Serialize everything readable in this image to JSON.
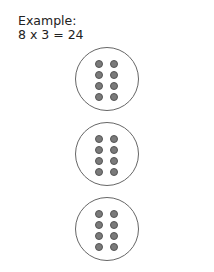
{
  "example": {
    "label": "Example:",
    "equation": "8 x 3 = 24"
  },
  "groups": [
    {
      "name": "group-1",
      "dots": 8
    },
    {
      "name": "group-2",
      "dots": 8
    },
    {
      "name": "group-3",
      "dots": 8
    }
  ],
  "colors": {
    "circle_stroke": "#666666",
    "dot_fill": "#7a7a7a",
    "dot_stroke": "#555555"
  }
}
